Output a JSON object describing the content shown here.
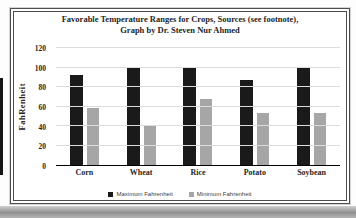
{
  "colors": {
    "max_bar": "#1a1a1a",
    "min_bar": "#a6a6a6",
    "gridline": "#dcdcdc",
    "frame_border": "#4d4d4d",
    "text": "#262626"
  },
  "chart_data": {
    "type": "bar",
    "title": "Favorable Temperature Ranges for Crops, Sources (see footnote), Graph by Dr. Steven Nur Ahmed",
    "title_lines": [
      "Favorable Temperature Ranges for Crops, Sources (see footnote),",
      "Graph by Dr. Steven Nur Ahmed"
    ],
    "categories": [
      "Corn",
      "Wheat",
      "Rice",
      "Potato",
      "Soybean"
    ],
    "series": [
      {
        "name": "Maximum Fahrenheit",
        "color": "#1a1a1a",
        "values": [
          92,
          100,
          100,
          87,
          100
        ]
      },
      {
        "name": "Minimum Fahrenheit",
        "color": "#a6a6a6",
        "values": [
          58,
          41,
          68,
          53,
          53
        ]
      }
    ],
    "ylabel": "FahRenheit",
    "xlabel": "",
    "yticks": [
      0,
      20,
      40,
      60,
      80,
      100,
      120
    ],
    "ylim": [
      0,
      120
    ],
    "grid": true,
    "legend_position": "bottom"
  }
}
